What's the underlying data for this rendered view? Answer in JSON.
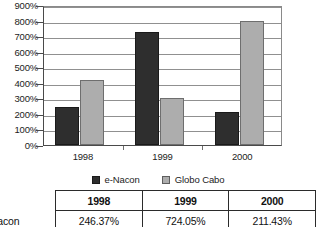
{
  "chart_data": {
    "type": "bar",
    "title": "",
    "subtitle": "",
    "xlabel": "",
    "ylabel": "",
    "categories": [
      "1998",
      "1999",
      "2000"
    ],
    "series": [
      {
        "name": "e-Nacon",
        "values": [
          246.37,
          724.05,
          211.43
        ],
        "color": "#2e2e2e"
      },
      {
        "name": "Globo Cabo",
        "values": [
          420.0,
          305.0,
          800.0
        ],
        "color": "#adadad"
      }
    ],
    "ylim": [
      0,
      900
    ],
    "ytick_step": 100,
    "ytick_labels": [
      "0%",
      "100%",
      "200%",
      "300%",
      "400%",
      "500%",
      "600%",
      "700%",
      "800%",
      "900%"
    ],
    "value_suffix": "%",
    "grid": true,
    "grid_axis": "y",
    "legend_position": "bottom"
  },
  "legend": {
    "entries": [
      {
        "label": "e-Nacon",
        "swatch": "dark"
      },
      {
        "label": "Globo Cabo",
        "swatch": "light"
      }
    ]
  },
  "table": {
    "corner_label": "",
    "headers": [
      "1998",
      "1999",
      "2000"
    ],
    "rows": [
      {
        "label": "e-Nacon",
        "values": [
          "246.37%",
          "724.05%",
          "211.43%"
        ]
      }
    ]
  }
}
